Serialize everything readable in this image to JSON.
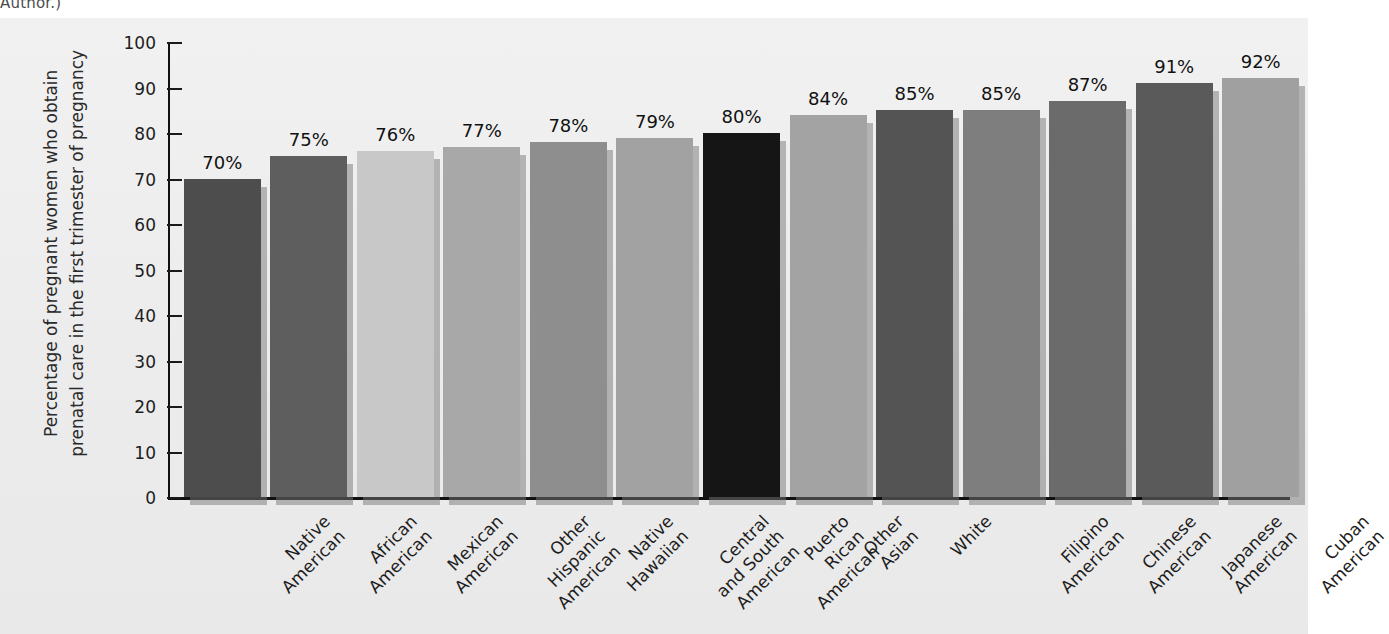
{
  "page": {
    "top_text_fragment": "Author.)"
  },
  "chart_data": {
    "type": "bar",
    "title": "",
    "xlabel": "",
    "ylabel": "Percentage of pregnant women who obtain prenatal care in the first trimester of pregnancy",
    "ylabel_lines": [
      "Percentage of pregnant women who obtain",
      "prenatal care in the first trimester of pregnancy"
    ],
    "ylim": [
      0,
      100
    ],
    "yticks": [
      0,
      10,
      20,
      30,
      40,
      50,
      60,
      70,
      80,
      90,
      100
    ],
    "ytick_labels": [
      "0",
      "10",
      "20",
      "30",
      "40",
      "50",
      "60",
      "70",
      "80",
      "90",
      "100"
    ],
    "grid": false,
    "legend": false,
    "legend_position": "none",
    "value_label_suffix": "%",
    "categories": [
      "Native American",
      "African American",
      "Mexican American",
      "Other Hispanic American",
      "Native Hawaiian",
      "Central and South American",
      "Puerto Rican American",
      "Other Asian",
      "White",
      "Filipino American",
      "Chinese American",
      "Japanese American",
      "Cuban American"
    ],
    "category_lines": [
      [
        "Native",
        "American"
      ],
      [
        "African",
        "American"
      ],
      [
        "Mexican",
        "American"
      ],
      [
        "Other",
        "Hispanic",
        "American"
      ],
      [
        "Native",
        "Hawaiian"
      ],
      [
        "Central",
        "and South",
        "American"
      ],
      [
        "Puerto",
        "Rican",
        "American"
      ],
      [
        "Other",
        "Asian"
      ],
      [
        "White"
      ],
      [
        "Filipino",
        "American"
      ],
      [
        "Chinese",
        "American"
      ],
      [
        "Japanese",
        "American"
      ],
      [
        "Cuban",
        "American"
      ]
    ],
    "values": [
      70,
      75,
      76,
      77,
      78,
      79,
      80,
      84,
      85,
      85,
      87,
      91,
      92
    ],
    "value_labels": [
      "70%",
      "75%",
      "76%",
      "77%",
      "78%",
      "79%",
      "80%",
      "84%",
      "85%",
      "85%",
      "87%",
      "91%",
      "92%"
    ],
    "bar_colors": [
      "#4d4d4d",
      "#5e5e5e",
      "#c8c8c8",
      "#a8a8a8",
      "#8e8e8e",
      "#a2a2a2",
      "#151515",
      "#a3a3a3",
      "#545454",
      "#7e7e7e",
      "#6b6b6b",
      "#5a5a5a",
      "#a0a0a0"
    ]
  },
  "colors": {
    "panel_background": "#efefef",
    "axis": "#111111",
    "text": "#1d1d1d",
    "bar_shadow": "rgba(120,120,120,0.5)"
  }
}
